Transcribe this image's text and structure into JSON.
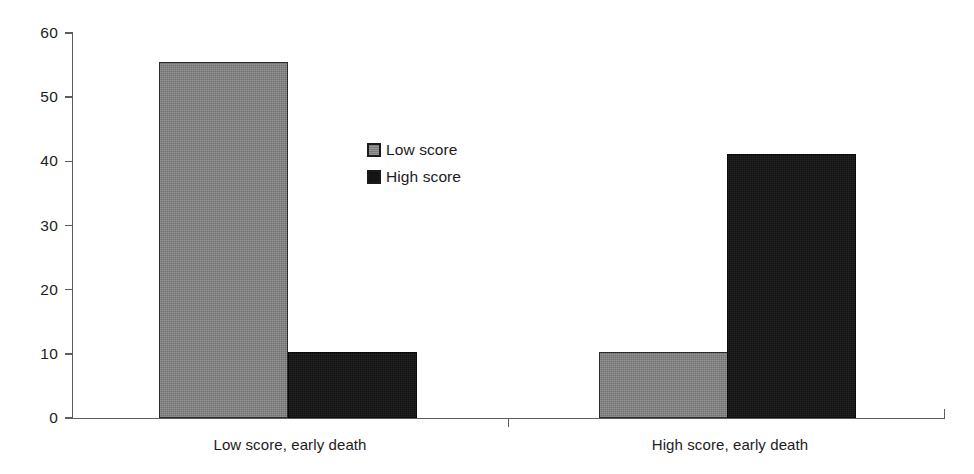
{
  "chart_data": {
    "type": "bar",
    "title": "",
    "subtitle": "",
    "xlabel": "",
    "ylabel": "",
    "categories": [
      "Low score, early death",
      "High score, early death"
    ],
    "series": [
      {
        "name": "Low score",
        "values": [
          55,
          10.3
        ],
        "color": "#838383"
      },
      {
        "name": "High score",
        "values": [
          10.3,
          40.5
        ],
        "color": "#141414"
      }
    ],
    "ylim": [
      0,
      60
    ],
    "yticks": [
      0,
      10,
      20,
      30,
      40,
      50,
      60
    ],
    "ytick_labels": [
      "0",
      "10",
      "20",
      "30",
      "40",
      "50",
      "60"
    ],
    "grid": false,
    "legend": {
      "position": "inside-upper-center-left",
      "entries": [
        {
          "label": "Low score",
          "swatch": "gray"
        },
        {
          "label": "High score",
          "swatch": "black"
        }
      ]
    }
  },
  "axis": {
    "y_tick_labels": [
      "60",
      "50",
      "40",
      "30",
      "20",
      "10",
      "0"
    ]
  }
}
